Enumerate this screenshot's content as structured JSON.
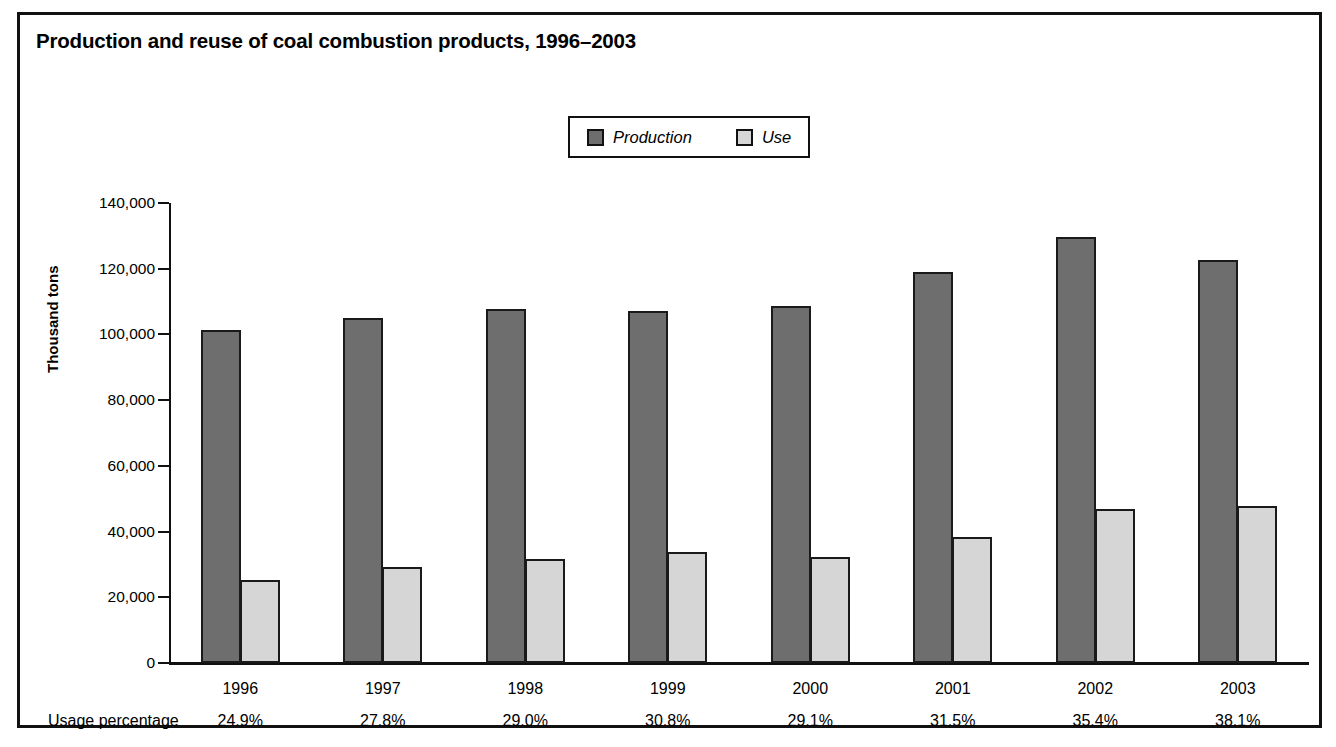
{
  "chart_data": {
    "type": "bar",
    "title": "Production and reuse of coal combustion products, 1996–2003",
    "xlabel": "",
    "ylabel": "Thousand tons",
    "ylim": [
      0,
      140000
    ],
    "ytick_labels": [
      "140,000",
      "120,000",
      "100,000",
      "80,000",
      "60,000",
      "40,000",
      "20,000",
      "0"
    ],
    "yticks": [
      140000,
      120000,
      100000,
      80000,
      60000,
      40000,
      20000,
      0
    ],
    "grid": false,
    "legend_position": "top-center",
    "categories": [
      "1996",
      "1997",
      "1998",
      "1999",
      "2000",
      "2001",
      "2002",
      "2003"
    ],
    "series": [
      {
        "name": "Production",
        "color": "#6e6e6e",
        "values": [
          101400,
          104900,
          107800,
          107200,
          108800,
          118900,
          129700,
          122700
        ]
      },
      {
        "name": "Use",
        "color": "#d6d6d6",
        "values": [
          25300,
          29200,
          31800,
          33800,
          32400,
          38300,
          46900,
          47900
        ]
      }
    ],
    "annotations": {
      "usage_row_label": "Usage percentage",
      "usage_percentages": [
        "24.9%",
        "27.8%",
        "29.0%",
        "30.8%",
        "29.1%",
        "31.5%",
        "35.4%",
        "38.1%"
      ]
    }
  },
  "legend": {
    "entries": [
      {
        "label": "Production",
        "swatch": "production"
      },
      {
        "label": "Use",
        "swatch": "use"
      }
    ]
  },
  "colors": {
    "production": "#6e6e6e",
    "use": "#d6d6d6",
    "outline": "#111111",
    "background": "#ffffff"
  },
  "bottom_bleed_text": "· · · · · · · · · · · · · · · · · · · · · · · · · · ·"
}
